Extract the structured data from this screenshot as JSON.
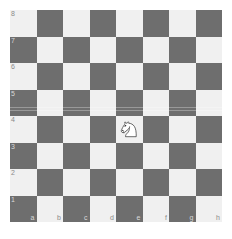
{
  "board": {
    "files": [
      "a",
      "b",
      "c",
      "d",
      "e",
      "f",
      "g",
      "h"
    ],
    "ranks": [
      "8",
      "7",
      "6",
      "5",
      "4",
      "3",
      "2",
      "1"
    ],
    "light_square_color": "#f0f0f0",
    "dark_square_color": "#6e6e6e",
    "label_color": "#8a8a8a",
    "background_color": "#ffffff",
    "orientation": "white-bottom",
    "size": 8
  },
  "pieces": [
    {
      "type": "knight",
      "color": "white",
      "square": "e4",
      "file": "e",
      "rank": "4",
      "icon": "white-knight-icon",
      "facing": "left"
    }
  ],
  "labels": {
    "rank_8": "8",
    "rank_7": "7",
    "rank_6": "6",
    "rank_5": "5",
    "rank_4": "4",
    "rank_3": "3",
    "rank_2": "2",
    "rank_1": "1",
    "file_a": "a",
    "file_b": "b",
    "file_c": "c",
    "file_d": "d",
    "file_e": "e",
    "file_f": "f",
    "file_g": "g",
    "file_h": "h"
  }
}
